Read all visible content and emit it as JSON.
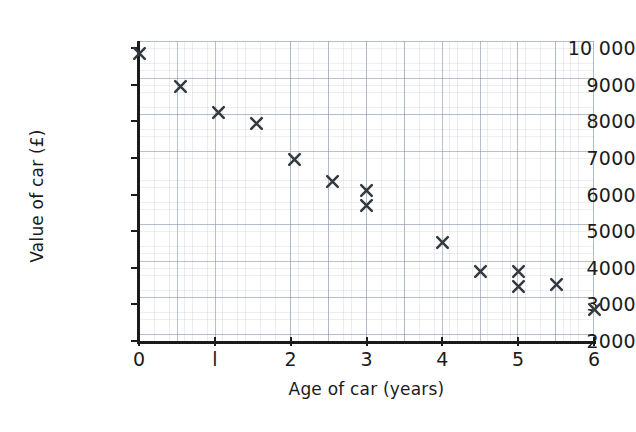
{
  "chart_data": {
    "type": "scatter",
    "title": "",
    "xlabel": "Age of car (years)",
    "ylabel": "Value of car (£)",
    "xlim": [
      0,
      6
    ],
    "ylim": [
      2000,
      10000
    ],
    "xticks": [
      "0",
      "l",
      "2",
      "3",
      "4",
      "5",
      "6"
    ],
    "xtick_values": [
      0,
      1,
      2,
      3,
      4,
      5,
      6
    ],
    "yticks": [
      "10 000",
      "9000",
      "8000",
      "7000",
      "6000",
      "5000",
      "4000",
      "3000",
      "2000"
    ],
    "ytick_values": [
      10000,
      9000,
      8000,
      7000,
      6000,
      5000,
      4000,
      3000,
      2000
    ],
    "grid": true,
    "grid_style": "graph-paper",
    "legend": "none",
    "marker": "x",
    "marker_color": "#333a3f",
    "points": [
      {
        "x": 0.0,
        "y": 9850
      },
      {
        "x": 0.55,
        "y": 8950
      },
      {
        "x": 1.05,
        "y": 8250
      },
      {
        "x": 1.55,
        "y": 7950
      },
      {
        "x": 2.05,
        "y": 6950
      },
      {
        "x": 2.55,
        "y": 6350
      },
      {
        "x": 3.0,
        "y": 6100
      },
      {
        "x": 3.0,
        "y": 5700
      },
      {
        "x": 4.0,
        "y": 4700
      },
      {
        "x": 4.5,
        "y": 3900
      },
      {
        "x": 5.0,
        "y": 3900
      },
      {
        "x": 5.0,
        "y": 3500
      },
      {
        "x": 5.5,
        "y": 3550
      },
      {
        "x": 6.0,
        "y": 2850
      }
    ]
  },
  "colors": {
    "axis": "#1b1b1b",
    "marker": "#333a3f",
    "grid_major": "#7884a0",
    "grid_minor": "#96a0b9",
    "background": "#ffffff"
  }
}
